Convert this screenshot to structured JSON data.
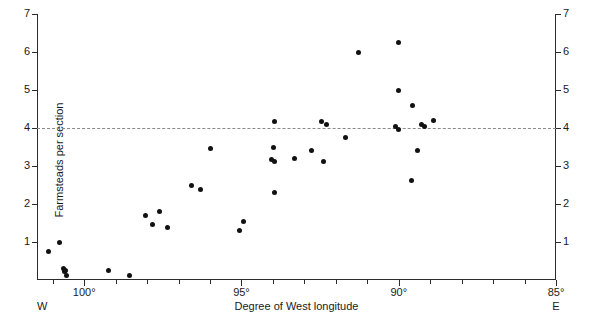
{
  "chart_data": {
    "type": "scatter",
    "title": "",
    "xlabel": "Degree of West longitude",
    "ylabel": "Farmsteads per section",
    "xlim": [
      101.5,
      85.0
    ],
    "ylim": [
      0,
      7
    ],
    "x_axis_direction": "west-to-east",
    "grid": false,
    "legend": null,
    "x_tick_labels": [
      "100°",
      "95°",
      "90°",
      "85°"
    ],
    "x_tick_values": [
      100,
      95,
      90,
      85
    ],
    "x_minor_tick_values": [
      101,
      99,
      98,
      97,
      96,
      94,
      93,
      92,
      91,
      89,
      88,
      87,
      86
    ],
    "y_tick_labels": [
      "1",
      "2",
      "3",
      "4",
      "5",
      "6",
      "7"
    ],
    "y_tick_values": [
      1,
      2,
      3,
      4,
      5,
      6,
      7
    ],
    "left_axis_labels": [
      "7",
      "6",
      "5",
      "4",
      "3",
      "2",
      "1"
    ],
    "right_axis_labels": [
      "7",
      "6",
      "5",
      "4",
      "3",
      "2",
      "1"
    ],
    "end_markers": {
      "west": "W",
      "east": "E"
    },
    "reference_line": {
      "y": 4,
      "style": "dashed",
      "color": "#8a8a8a"
    },
    "point_color": "#111111",
    "points": [
      {
        "x": 101.15,
        "y": 0.74
      },
      {
        "x": 100.8,
        "y": 1.0
      },
      {
        "x": 100.65,
        "y": 0.3
      },
      {
        "x": 100.63,
        "y": 0.22
      },
      {
        "x": 100.58,
        "y": 0.24
      },
      {
        "x": 100.55,
        "y": 0.12
      },
      {
        "x": 99.24,
        "y": 0.26
      },
      {
        "x": 98.57,
        "y": 0.13
      },
      {
        "x": 98.06,
        "y": 1.71
      },
      {
        "x": 97.84,
        "y": 1.47
      },
      {
        "x": 97.62,
        "y": 1.79
      },
      {
        "x": 97.34,
        "y": 1.37
      },
      {
        "x": 96.6,
        "y": 2.5
      },
      {
        "x": 96.29,
        "y": 2.37
      },
      {
        "x": 95.97,
        "y": 3.45
      },
      {
        "x": 95.05,
        "y": 1.29
      },
      {
        "x": 94.92,
        "y": 1.53
      },
      {
        "x": 93.94,
        "y": 4.18
      },
      {
        "x": 93.97,
        "y": 3.5
      },
      {
        "x": 94.03,
        "y": 3.16
      },
      {
        "x": 93.94,
        "y": 3.11
      },
      {
        "x": 93.94,
        "y": 2.29
      },
      {
        "x": 93.3,
        "y": 3.21
      },
      {
        "x": 92.76,
        "y": 3.42
      },
      {
        "x": 92.45,
        "y": 4.18
      },
      {
        "x": 92.29,
        "y": 4.08
      },
      {
        "x": 92.39,
        "y": 3.13
      },
      {
        "x": 91.69,
        "y": 3.74
      },
      {
        "x": 91.28,
        "y": 6.0
      },
      {
        "x": 90.0,
        "y": 6.26
      },
      {
        "x": 90.01,
        "y": 5.0
      },
      {
        "x": 90.09,
        "y": 4.03
      },
      {
        "x": 90.02,
        "y": 3.97
      },
      {
        "x": 89.56,
        "y": 4.58
      },
      {
        "x": 89.4,
        "y": 3.42
      },
      {
        "x": 89.28,
        "y": 4.08
      },
      {
        "x": 89.19,
        "y": 4.05
      },
      {
        "x": 88.88,
        "y": 4.21
      },
      {
        "x": 89.6,
        "y": 2.61
      }
    ]
  }
}
